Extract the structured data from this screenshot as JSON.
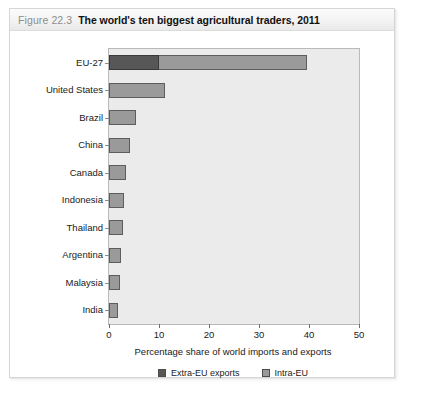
{
  "figure": {
    "number": "Figure 22.3",
    "title": "The world's ten biggest agricultural traders, 2011"
  },
  "chart_data": {
    "type": "bar",
    "orientation": "horizontal",
    "title": "The world's ten biggest agricultural traders, 2011",
    "xlabel": "Percentage share of world imports and exports",
    "ylabel": "",
    "xlim": [
      0,
      50
    ],
    "xticks": [
      0,
      10,
      20,
      30,
      40,
      50
    ],
    "grid": false,
    "legend_position": "bottom-center",
    "stacked": true,
    "categories": [
      "EU-27",
      "United States",
      "Brazil",
      "China",
      "Canada",
      "Indonesia",
      "Thailand",
      "Argentina",
      "Malaysia",
      "India"
    ],
    "series": [
      {
        "name": "Extra-EU exports",
        "color": "#575757",
        "values": [
          10.0,
          11.2,
          5.4,
          4.2,
          3.4,
          3.0,
          2.8,
          2.4,
          2.2,
          1.8
        ]
      },
      {
        "name": "Intra-EU",
        "color": "#9a9a9a",
        "values": [
          29.6,
          0,
          0,
          0,
          0,
          0,
          0,
          0,
          0,
          0
        ]
      }
    ],
    "bar_rendering": [
      {
        "category": "EU-27",
        "extra": 10.0,
        "intra": 29.6,
        "total": 39.6
      },
      {
        "category": "United States",
        "extra": 0,
        "intra": 11.2,
        "total": 11.2
      },
      {
        "category": "Brazil",
        "extra": 0,
        "intra": 5.4,
        "total": 5.4
      },
      {
        "category": "China",
        "extra": 0,
        "intra": 4.2,
        "total": 4.2
      },
      {
        "category": "Canada",
        "extra": 0,
        "intra": 3.4,
        "total": 3.4
      },
      {
        "category": "Indonesia",
        "extra": 0,
        "intra": 3.0,
        "total": 3.0
      },
      {
        "category": "Thailand",
        "extra": 0,
        "intra": 2.8,
        "total": 2.8
      },
      {
        "category": "Argentina",
        "extra": 0,
        "intra": 2.4,
        "total": 2.4
      },
      {
        "category": "Malaysia",
        "extra": 0,
        "intra": 2.2,
        "total": 2.2
      },
      {
        "category": "India",
        "extra": 0,
        "intra": 1.8,
        "total": 1.8
      }
    ],
    "legend": [
      {
        "label": "Extra-EU exports",
        "color": "#575757"
      },
      {
        "label": "Intra-EU",
        "color": "#9a9a9a"
      }
    ]
  },
  "colors": {
    "extra_eu": "#575757",
    "intra_eu": "#9a9a9a",
    "plot_background": "#ebebeb",
    "frame_border": "#d6d6d6",
    "title_number": "#8e8e8e"
  }
}
